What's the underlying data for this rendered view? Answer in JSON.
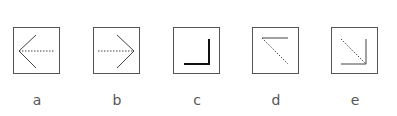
{
  "colors": {
    "box_stroke": "#555555",
    "line_stroke": "#444444",
    "bold_stroke": "#111111",
    "label_text": "#555555"
  },
  "options": [
    {
      "label": "a",
      "icon": "arrow-left-dashed-shaft-icon",
      "description": "Left-pointing arrowhead with dotted horizontal shaft"
    },
    {
      "label": "b",
      "icon": "arrow-right-dashed-shaft-icon",
      "description": "Right-pointing arrowhead with dotted horizontal shaft"
    },
    {
      "label": "c",
      "icon": "corner-bottom-right-icon",
      "description": "Bold L-shaped corner at bottom-right"
    },
    {
      "label": "d",
      "icon": "arrow-up-left-dashed-icon",
      "description": "Top horizontal line with dotted diagonal toward bottom-right"
    },
    {
      "label": "e",
      "icon": "arrow-down-right-dashed-icon",
      "description": "Dotted diagonal ending at bottom-right corner of an L"
    }
  ]
}
